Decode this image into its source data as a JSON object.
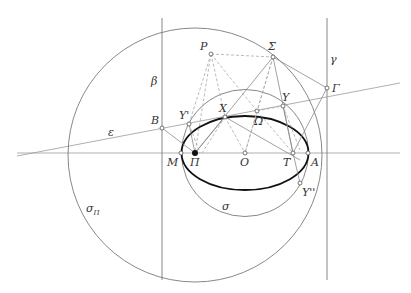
{
  "figure": {
    "colors": {
      "line": "#7a7a7a",
      "thin_line": "#9a9a9a",
      "dashed": "#a8a8a8",
      "ellipse": "#111111",
      "label": "#333333",
      "point_fill": "#ffffff",
      "focus_fill": "#111111"
    }
  },
  "labels": {
    "P": "P",
    "Sigma": "Σ",
    "gamma": "γ",
    "beta": "β",
    "Gamma": "Γ",
    "Upsilon": "Υ",
    "Upsilon_prime": "Υ'",
    "X": "X",
    "Omega": "Ω",
    "B": "B",
    "epsilon": "ε",
    "M": "M",
    "Pi": "Π",
    "O": "O",
    "T": "T",
    "A": "A",
    "Upsilon_double": "Υ''",
    "sigma": "σ",
    "sigma_Pi_main": "σ",
    "sigma_Pi_sub": "Π"
  }
}
